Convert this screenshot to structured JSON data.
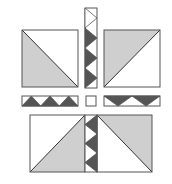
{
  "colors": {
    "light_fabric": "#cfcfcf",
    "dark_fabric": "#555555",
    "background_fabric": "#ffffff",
    "outline": "#555555"
  },
  "blocks": [
    {
      "name": "half-square-triangle-top-left",
      "shaded": "lower-left"
    },
    {
      "name": "half-square-triangle-top-right",
      "shaded": "upper-left"
    },
    {
      "name": "half-square-triangle-bottom-left",
      "shaded": "lower-right"
    },
    {
      "name": "half-square-triangle-bottom-right",
      "shaded": "upper-right"
    }
  ],
  "sashing": {
    "top_vertical_triangles": 4,
    "bottom_vertical_triangles": 3,
    "left_horizontal_triangles": 3,
    "right_horizontal_triangles": 2,
    "center_square": "plain"
  }
}
